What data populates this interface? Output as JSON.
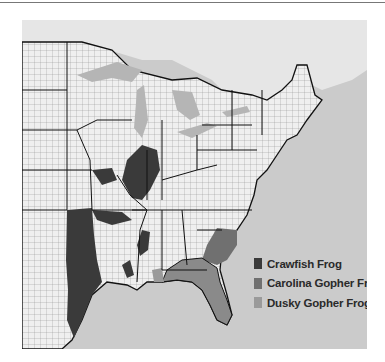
{
  "map": {
    "title": "",
    "region": "Eastern United States county map",
    "colors": {
      "water": "#c9c9c9",
      "land": "#eeeeee",
      "county_lines": "#888888",
      "state_lines": "#111111",
      "great_lakes": "#b5b5b5",
      "canada": "#e4e4e4"
    }
  },
  "legend": {
    "items": [
      {
        "label": "Crawfish Frog",
        "color": "#3a3a3a"
      },
      {
        "label": "Carolina Gopher Frog",
        "color": "#707070"
      },
      {
        "label": "Dusky Gopher Frog",
        "color": "#9a9a9a"
      }
    ]
  }
}
